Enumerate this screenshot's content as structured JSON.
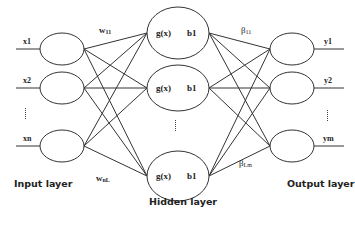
{
  "diagram": {
    "type": "neural-network (single hidden layer feedforward)",
    "layers": {
      "input": {
        "title": "Input layer",
        "nodes": [
          "x1",
          "x2",
          "xn"
        ],
        "ellipsis": "vertical dots between x2 and xn"
      },
      "hidden": {
        "title": "Hidden layer",
        "nodes": [
          {
            "activation": "g(x)",
            "bias": "b1"
          },
          {
            "activation": "g(x)",
            "bias": "b1"
          },
          {
            "activation": "g(x)",
            "bias": "b1"
          }
        ],
        "ellipsis": "vertical dots between second and last hidden node"
      },
      "output": {
        "title": "Output layer",
        "nodes": [
          "y1",
          "y2",
          "ym"
        ],
        "ellipsis": "vertical dots between y2 and ym"
      }
    },
    "weights": {
      "input_hidden_first": {
        "symbol": "w",
        "sub": "11"
      },
      "input_hidden_last": {
        "symbol": "w",
        "sub": "nL"
      },
      "hidden_output_first": {
        "symbol": "β",
        "sub": "11"
      },
      "hidden_output_last": {
        "symbol": "β",
        "sub": "Lm"
      }
    },
    "connectivity": "fully connected between adjacent layers",
    "colors": {
      "stroke": "#333333",
      "background": "#ffffff",
      "text": "#222222"
    }
  }
}
